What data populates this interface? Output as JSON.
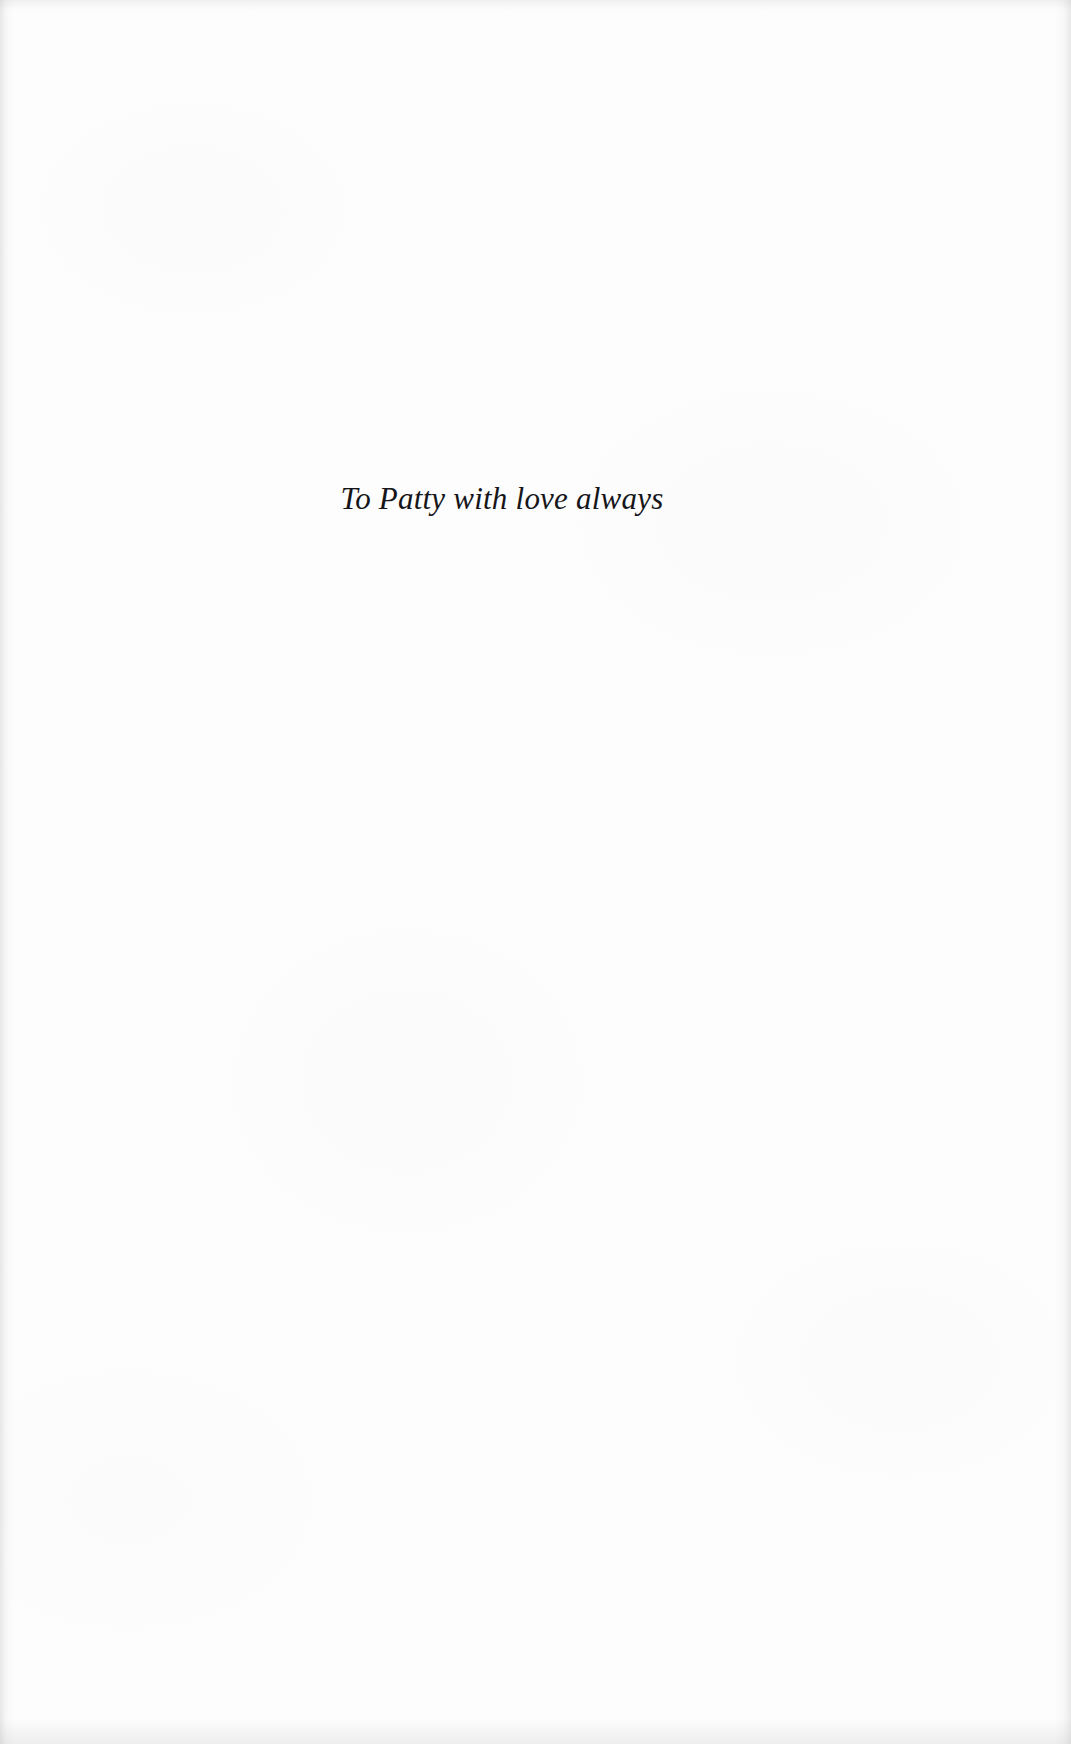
{
  "page": {
    "kind": "book-dedication-page",
    "background_color": "#fdfdfd",
    "width": 1071,
    "height": 1744
  },
  "dedication": {
    "text": "To Patty with love always",
    "style": "italic-serif",
    "alignment": "center",
    "text_color": "#16161a"
  },
  "artifacts": {
    "left_edge_shadow": "#78787d",
    "right_edge_shadow": "#78787d",
    "bottom_edge_shadow": "#7d7d82"
  }
}
